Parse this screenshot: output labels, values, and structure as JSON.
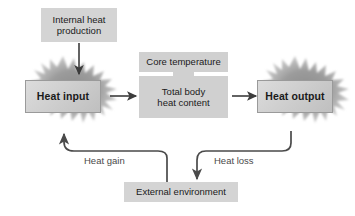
{
  "diagram": {
    "background_color": "#ffffff",
    "box_fill": "#d2d2d2",
    "burst_color": "#9e9e9e",
    "arrow_color": "#3c3c3c",
    "label_color": "#4a4a4a",
    "nodes": {
      "internal_heat": "Internal heat\nproduction",
      "internal_heat_line1": "Internal heat",
      "internal_heat_line2": "production",
      "heat_input": "Heat input",
      "core_temperature": "Core temperature",
      "total_body_line1": "Total body",
      "total_body_line2": "heat content",
      "heat_output": "Heat output",
      "external_environment": "External environment"
    },
    "edges": {
      "heat_gain": "Heat gain",
      "heat_loss": "Heat loss"
    }
  }
}
